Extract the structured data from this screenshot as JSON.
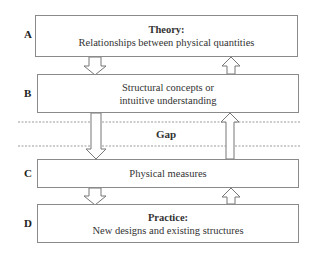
{
  "diagram": {
    "rows": [
      {
        "label": "A",
        "title": "Theory:",
        "text": "Relationships between physical quantities"
      },
      {
        "label": "B",
        "title": "",
        "line1": "Structural concepts or",
        "line2": "intuitive understanding"
      },
      {
        "label": "C",
        "title": "",
        "text": "Physical measures"
      },
      {
        "label": "D",
        "title": "Practice:",
        "text": "New designs and existing structures"
      }
    ],
    "gap_label": "Gap",
    "colors": {
      "border": "#8a8a8a",
      "text": "#333333",
      "dash": "#9a9a9a"
    }
  }
}
